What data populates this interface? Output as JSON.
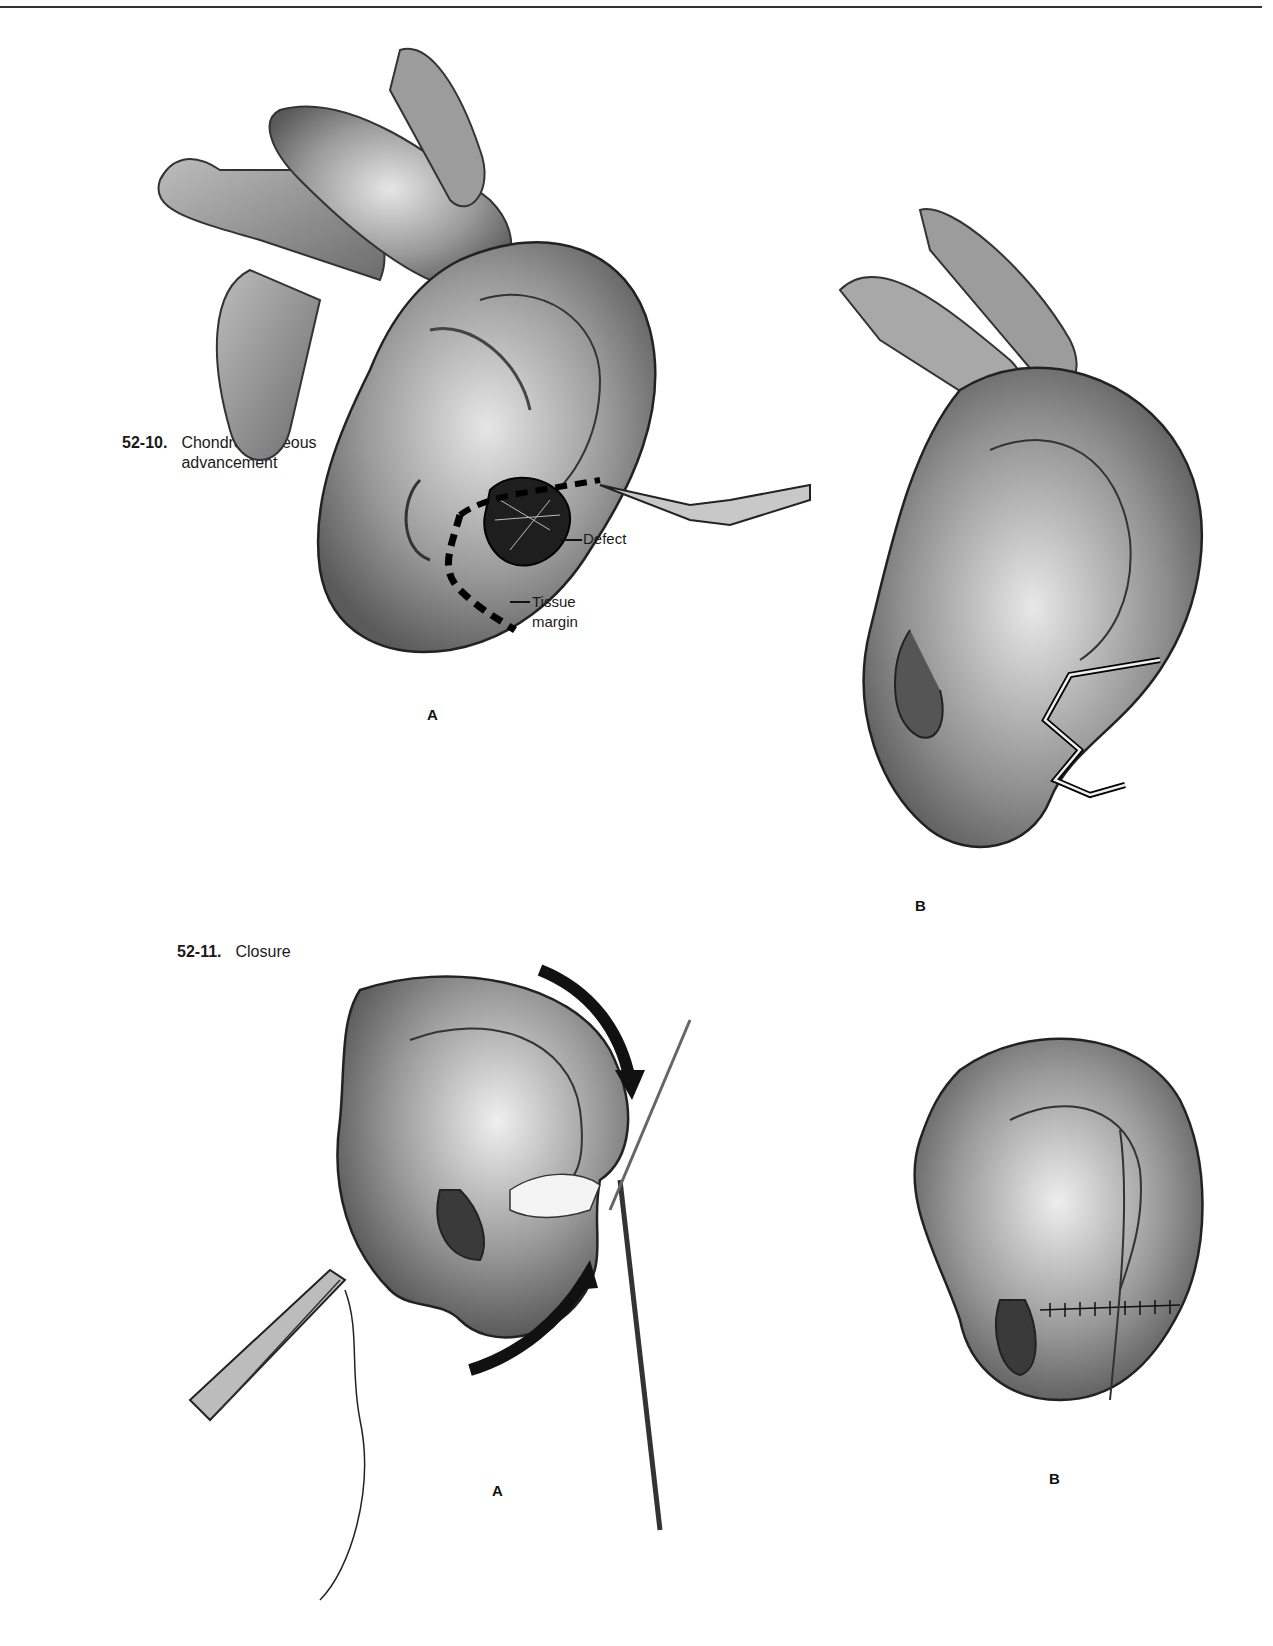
{
  "page": {
    "header_rule": true
  },
  "figures": [
    {
      "number": "52-10.",
      "caption_line1": "Chondrocutaneous",
      "caption_line2": "advancement",
      "panels": [
        {
          "letter": "A",
          "callouts": [
            {
              "text": "Defect"
            },
            {
              "text_line1": "Tissue",
              "text_line2": "margin"
            }
          ],
          "illustration": "ear-with-defect-and-scalpel-incision"
        },
        {
          "letter": "B",
          "illustration": "ear-after-chondrocutaneous-incision"
        }
      ]
    },
    {
      "number": "52-11.",
      "caption": "Closure",
      "panels": [
        {
          "letter": "A",
          "illustration": "ear-flaps-advanced-with-needle-holder-and-arrows"
        },
        {
          "letter": "B",
          "illustration": "ear-after-sutured-closure"
        }
      ]
    }
  ]
}
